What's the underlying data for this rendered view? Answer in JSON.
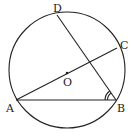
{
  "diagram": {
    "type": "circle-geometry",
    "labels": {
      "D": "D",
      "C": "C",
      "O": "O",
      "A": "A",
      "B": "B"
    },
    "segments": [
      "AB",
      "AC",
      "BD"
    ],
    "center_label": "O",
    "marked_angle": "ABD",
    "marked_angle_arcs": 2,
    "colors": {
      "stroke": "#222222",
      "background": "#ffffff"
    }
  }
}
